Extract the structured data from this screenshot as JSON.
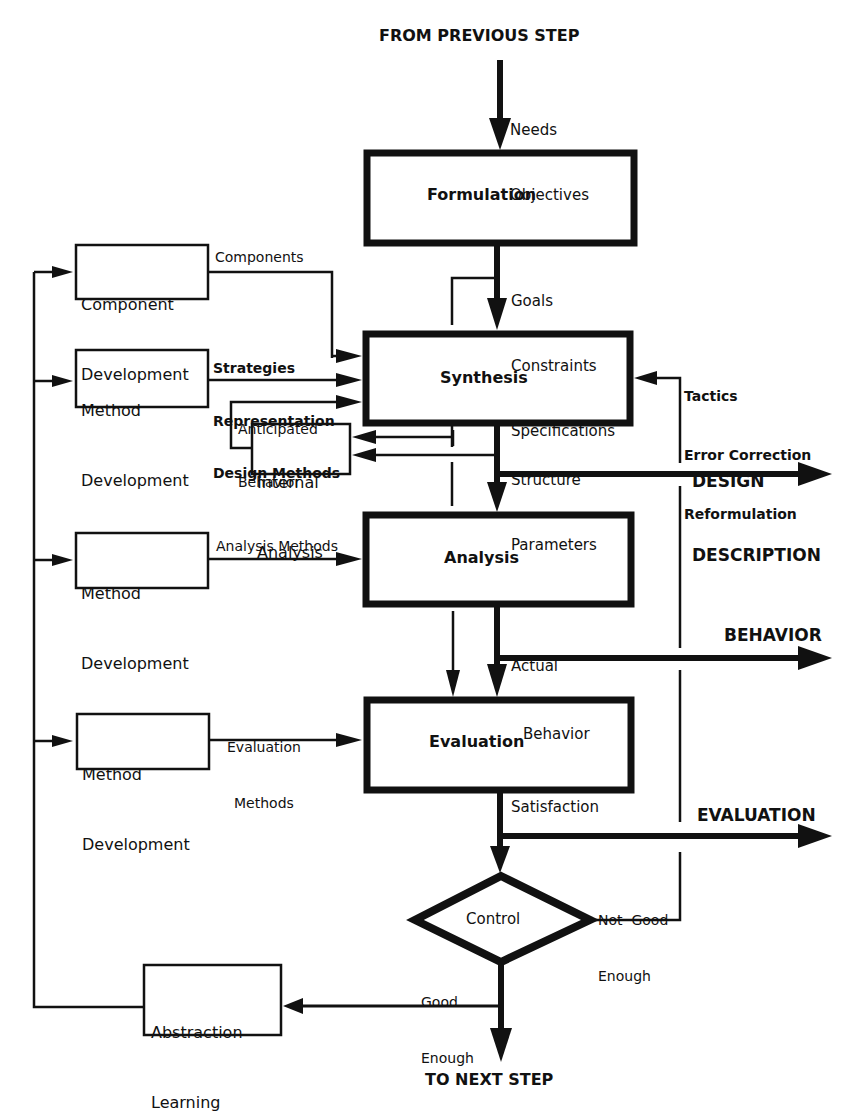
{
  "diagram": {
    "entry_label": "FROM PREVIOUS STEP",
    "exit_label": "TO NEXT STEP",
    "main_blocks": {
      "formulation": "Formulation",
      "synthesis": "Synthesis",
      "analysis": "Analysis",
      "evaluation": "Evaluation",
      "control": "Control"
    },
    "side_blocks": {
      "component_development": [
        "Component",
        "Development"
      ],
      "method_development_synthesis": [
        "Method",
        "Development"
      ],
      "internal_analysis": [
        "Internal",
        "Analysis"
      ],
      "method_development_analysis": [
        "Method",
        "Development"
      ],
      "method_development_evaluation": [
        "Method",
        "Development"
      ],
      "abstraction_learning": [
        "Abstraction",
        "Learning"
      ]
    },
    "flow_labels": {
      "needs_objectives": [
        "Needs",
        "Objectives"
      ],
      "goals_constraints_specs": [
        "Goals",
        "Constraints",
        "Specifications"
      ],
      "components": "Components",
      "strategies": [
        "Strategies",
        "Representation",
        "Design Methods"
      ],
      "anticipated_behavior": [
        "Anticipated",
        "Behavior"
      ],
      "tactics": [
        "Tactics",
        "Error Correction",
        "Reformulation"
      ],
      "structure_parameters": [
        "Structure",
        "Parameters"
      ],
      "analysis_methods": "Analysis Methods",
      "actual_behavior": [
        "Actual",
        "Behavior"
      ],
      "evaluation_methods": [
        "Evaluation",
        "Methods"
      ],
      "satisfaction": "Satisfaction",
      "not_good_enough": [
        "Not  Good",
        "Enough"
      ],
      "good_enough": [
        "Good",
        "Enough"
      ]
    },
    "outputs": {
      "design_description": [
        "DESIGN",
        "DESCRIPTION"
      ],
      "behavior": "BEHAVIOR",
      "evaluation": "EVALUATION"
    },
    "colors": {
      "ink": "#111111",
      "background": "#ffffff"
    }
  }
}
